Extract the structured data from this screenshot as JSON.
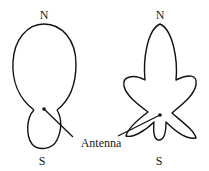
{
  "diagram": {
    "type": "antenna-radiation-patterns",
    "left_pattern": {
      "north_label": "N",
      "south_label": "S",
      "description": "directional pattern: large front lobe to N, small back lobe to S"
    },
    "right_pattern": {
      "north_label": "N",
      "south_label": "S",
      "description": "multi-lobe pattern: main lobe to N with side and back lobes"
    },
    "callout_label": "Antenna",
    "colors": {
      "line": "#111111",
      "background": "#ffffff"
    }
  }
}
